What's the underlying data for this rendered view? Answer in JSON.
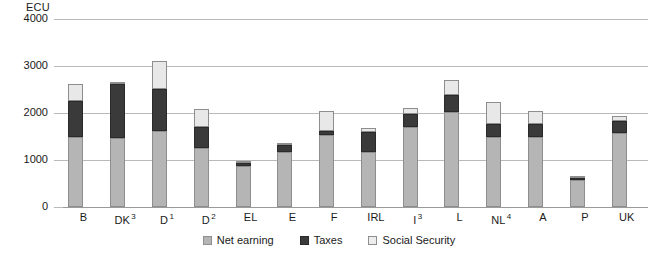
{
  "chart_data": {
    "type": "bar",
    "subtype": "stacked-vertical",
    "title": "",
    "xlabel": "",
    "ylabel": "ECU",
    "unit_label": "ECU",
    "ylim": [
      0,
      4000
    ],
    "ytick_labels": [
      "4000",
      "3000",
      "2000",
      "1000",
      "0"
    ],
    "ytick_values": [
      4000,
      3000,
      2000,
      1000,
      0
    ],
    "grid": true,
    "legend_position": "bottom-center",
    "categories": [
      "B",
      "DK",
      "D",
      "D",
      "EL",
      "E",
      "F",
      "IRL",
      "I",
      "L",
      "NL",
      "A",
      "P",
      "UK"
    ],
    "category_superscripts": [
      "",
      "3",
      "1",
      "2",
      "",
      "",
      "",
      "",
      "3",
      "",
      "4",
      "",
      "",
      ""
    ],
    "series": [
      {
        "name": "Net earning",
        "color": "#b5b5b5",
        "values": [
          1500,
          1470,
          1620,
          1250,
          870,
          1160,
          1530,
          1170,
          1700,
          2030,
          1480,
          1490,
          570,
          1570
        ]
      },
      {
        "name": "Taxes",
        "color": "#3a3a3a",
        "values": [
          750,
          1150,
          900,
          450,
          60,
          150,
          90,
          430,
          280,
          350,
          280,
          280,
          50,
          260
        ]
      },
      {
        "name": "Social Security",
        "color": "#e8e8e8",
        "values": [
          370,
          40,
          580,
          380,
          50,
          40,
          430,
          80,
          120,
          320,
          470,
          280,
          30,
          110
        ]
      }
    ],
    "totals": [
      2620,
      2660,
      3100,
      2080,
      980,
      1350,
      2050,
      1680,
      2100,
      2700,
      2230,
      2050,
      650,
      1940
    ]
  },
  "legend": {
    "items": [
      {
        "label": "Net earning",
        "key": "net"
      },
      {
        "label": "Taxes",
        "key": "tax"
      },
      {
        "label": "Social Security",
        "key": "soc"
      }
    ]
  },
  "colors": {
    "net_earning": "#b5b5b5",
    "taxes": "#3a3a3a",
    "social_security": "#e8e8e8",
    "gridline": "#b9b9b9",
    "text": "#1a1a1a",
    "background": "#ffffff"
  }
}
